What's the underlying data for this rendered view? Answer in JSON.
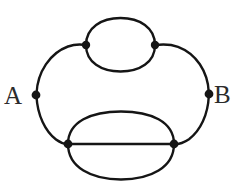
{
  "figure": {
    "type": "graph-diagram",
    "background_color": "#ffffff",
    "stroke_color": "#151515",
    "label_color": "#2b2b2b",
    "width": 245,
    "height": 183
  },
  "graph_data": {
    "type": "multigraph",
    "node_count": 6,
    "edge_count": 9,
    "nodes": [
      {
        "id": "A",
        "label": "A",
        "x": 36,
        "y": 95,
        "label_x": 22,
        "label_y": 104,
        "label_anchor": "end",
        "degree": 2,
        "terminal": true
      },
      {
        "id": "B",
        "label": "B",
        "x": 209,
        "y": 94,
        "label_x": 214,
        "label_y": 103,
        "label_anchor": "start",
        "degree": 2,
        "terminal": true
      },
      {
        "id": "C",
        "label": "",
        "x": 86,
        "y": 45,
        "degree": 3,
        "terminal": false
      },
      {
        "id": "D",
        "label": "",
        "x": 155,
        "y": 45,
        "degree": 3,
        "terminal": false
      },
      {
        "id": "E",
        "label": "",
        "x": 68,
        "y": 144,
        "degree": 4,
        "terminal": false
      },
      {
        "id": "F",
        "label": "",
        "x": 174,
        "y": 144,
        "degree": 4,
        "terminal": false
      }
    ],
    "edges": [
      {
        "from": "A",
        "to": "C",
        "shape": "arc",
        "multiplicity": 1
      },
      {
        "from": "A",
        "to": "E",
        "shape": "arc",
        "multiplicity": 1
      },
      {
        "from": "B",
        "to": "D",
        "shape": "arc",
        "multiplicity": 1
      },
      {
        "from": "B",
        "to": "F",
        "shape": "arc",
        "multiplicity": 1
      },
      {
        "from": "C",
        "to": "D",
        "shape": "arc-upper",
        "multiplicity": 2
      },
      {
        "from": "C",
        "to": "D",
        "shape": "arc-lower",
        "multiplicity": 2
      },
      {
        "from": "E",
        "to": "F",
        "shape": "arc-upper",
        "multiplicity": 3
      },
      {
        "from": "E",
        "to": "F",
        "shape": "straight-chord",
        "multiplicity": 3
      },
      {
        "from": "E",
        "to": "F",
        "shape": "arc-lower",
        "multiplicity": 3
      }
    ],
    "node_radius": 4.2,
    "stroke_width": 2.4
  }
}
